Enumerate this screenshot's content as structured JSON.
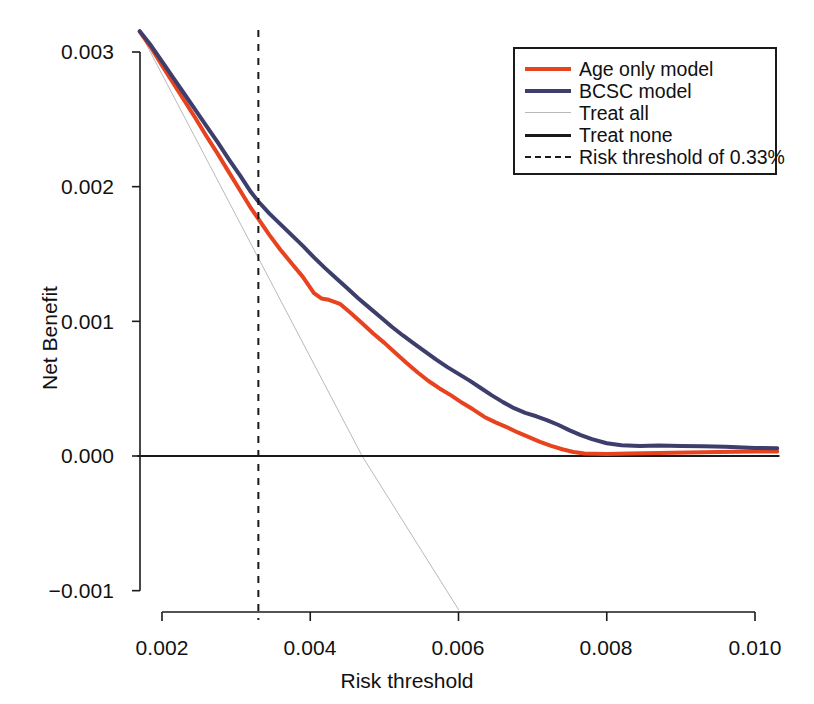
{
  "chart_data": {
    "type": "line",
    "title": "",
    "subtitle": "",
    "xlabel": "Risk threshold",
    "ylabel": "Net Benefit",
    "xlim": [
      0.00168,
      0.01032
    ],
    "ylim": [
      -0.00115,
      0.00318
    ],
    "xticks": [
      0.002,
      0.004,
      0.006,
      0.008,
      0.01
    ],
    "xtick_labels": [
      "0.002",
      "0.004",
      "0.006",
      "0.008",
      "0.010"
    ],
    "yticks": [
      -0.001,
      0.0,
      0.001,
      0.002,
      0.003
    ],
    "ytick_labels": [
      "−0.001",
      "0.000",
      "0.001",
      "0.002",
      "0.003"
    ],
    "grid": false,
    "legend_position": "upper right",
    "legend_entries": [
      {
        "label": "Age only model",
        "color": "#E8431F",
        "style": "solid",
        "width": 4
      },
      {
        "label": "BCSC model",
        "color": "#3D3E6B",
        "style": "solid",
        "width": 4
      },
      {
        "label": "Treat all",
        "color": "#B9B9B9",
        "style": "solid",
        "width": 1
      },
      {
        "label": "Treat none",
        "color": "#1A1A1A",
        "style": "solid",
        "width": 2
      },
      {
        "label": "Risk threshold of 0.33%",
        "color": "#1A1A1A",
        "style": "dashed",
        "width": 2
      }
    ],
    "annotations": [
      {
        "name": "risk-threshold-line",
        "type": "vline",
        "x": 0.0033,
        "label": "Risk threshold of 0.33%",
        "style": "dashed",
        "color": "#1A1A1A"
      }
    ],
    "series": [
      {
        "name": "Age only model",
        "color": "#E8431F",
        "style": "solid",
        "width": 4,
        "x": [
          0.0017,
          0.00185,
          0.002,
          0.00215,
          0.0023,
          0.00245,
          0.0026,
          0.00275,
          0.0029,
          0.00305,
          0.0032,
          0.0033,
          0.00345,
          0.0036,
          0.00375,
          0.0039,
          0.00405,
          0.00415,
          0.00425,
          0.0044,
          0.00455,
          0.0047,
          0.00485,
          0.005,
          0.00515,
          0.0053,
          0.00545,
          0.0056,
          0.00575,
          0.0059,
          0.00605,
          0.0062,
          0.00635,
          0.0065,
          0.00665,
          0.0068,
          0.00695,
          0.0071,
          0.00725,
          0.0074,
          0.00755,
          0.0077,
          0.008,
          0.0083,
          0.0087,
          0.0091,
          0.0095,
          0.01,
          0.0103
        ],
        "y": [
          0.00315,
          0.003035,
          0.0029,
          0.00277,
          0.00264,
          0.00251,
          0.002375,
          0.002245,
          0.00211,
          0.001975,
          0.00184,
          0.00176,
          0.00164,
          0.00153,
          0.00143,
          0.00133,
          0.00121,
          0.00117,
          0.00116,
          0.00113,
          0.00106,
          0.000985,
          0.00091,
          0.00084,
          0.000765,
          0.00069,
          0.00062,
          0.000555,
          0.0005,
          0.00045,
          0.000395,
          0.000345,
          0.00029,
          0.00025,
          0.000215,
          0.000175,
          0.00014,
          0.000105,
          7.5e-05,
          5e-05,
          3e-05,
          1.8e-05,
          1.5e-05,
          1.8e-05,
          2.2e-05,
          2.6e-05,
          3e-05,
          3.3e-05,
          3.4e-05
        ]
      },
      {
        "name": "BCSC model",
        "color": "#3D3E6B",
        "style": "solid",
        "width": 4,
        "x": [
          0.0017,
          0.00185,
          0.002,
          0.00215,
          0.0023,
          0.00245,
          0.0026,
          0.00275,
          0.0029,
          0.00305,
          0.0032,
          0.0033,
          0.00345,
          0.0036,
          0.00375,
          0.0039,
          0.00405,
          0.0042,
          0.00435,
          0.0045,
          0.00465,
          0.0048,
          0.00495,
          0.0051,
          0.00525,
          0.0054,
          0.00555,
          0.0057,
          0.00585,
          0.006,
          0.00615,
          0.0063,
          0.00645,
          0.0066,
          0.00675,
          0.0069,
          0.00705,
          0.0072,
          0.00735,
          0.0075,
          0.00765,
          0.0078,
          0.008,
          0.0082,
          0.00845,
          0.0087,
          0.009,
          0.0093,
          0.0096,
          0.01,
          0.0103
        ],
        "y": [
          0.003155,
          0.00305,
          0.00293,
          0.00281,
          0.00269,
          0.00257,
          0.00245,
          0.00233,
          0.002205,
          0.002085,
          0.00196,
          0.00189,
          0.0018,
          0.00172,
          0.00164,
          0.00156,
          0.001475,
          0.001395,
          0.00132,
          0.001245,
          0.00117,
          0.0011,
          0.00103,
          0.00096,
          0.000895,
          0.000835,
          0.000775,
          0.000715,
          0.00066,
          0.00061,
          0.00056,
          0.000505,
          0.00045,
          0.0004,
          0.000355,
          0.00032,
          0.000295,
          0.000265,
          0.00023,
          0.00019,
          0.000155,
          0.000125,
          9.5e-05,
          8e-05,
          7.5e-05,
          7.8e-05,
          7.5e-05,
          7.2e-05,
          6.8e-05,
          6e-05,
          5.8e-05
        ]
      },
      {
        "name": "Treat all",
        "color": "#B9B9B9",
        "style": "solid",
        "width": 1,
        "x": [
          0.0017,
          0.0047,
          0.006
        ],
        "y": [
          0.00315,
          0.0,
          -0.00114
        ]
      },
      {
        "name": "Treat none",
        "color": "#1A1A1A",
        "style": "solid",
        "width": 2,
        "x": [
          0.00168,
          0.01032
        ],
        "y": [
          0.0,
          0.0
        ]
      }
    ]
  },
  "legend": {
    "items": [
      {
        "label": "Age only model"
      },
      {
        "label": "BCSC model"
      },
      {
        "label": "Treat all"
      },
      {
        "label": "Treat none"
      },
      {
        "label": "Risk threshold of 0.33%"
      }
    ]
  },
  "axes": {
    "x_title": "Risk threshold",
    "y_title": "Net Benefit",
    "x_tick_labels": [
      "0.002",
      "0.004",
      "0.006",
      "0.008",
      "0.010"
    ],
    "y_tick_labels": [
      "0.003",
      "0.002",
      "0.001",
      "0.000",
      "−0.001"
    ]
  }
}
